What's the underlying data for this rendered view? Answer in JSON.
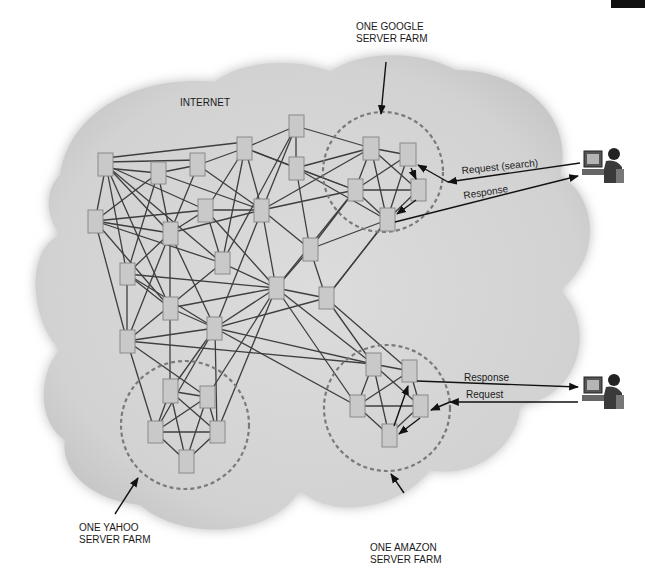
{
  "labels": {
    "internet": "INTERNET",
    "google_line1": "ONE GOOGLE",
    "google_line2": "SERVER FARM",
    "yahoo_line1": "ONE YAHOO",
    "yahoo_line2": "SERVER FARM",
    "amazon_line1": "ONE AMAZON",
    "amazon_line2": "SERVER FARM",
    "request_search": "Request (search)",
    "response_top": "Response",
    "response_bottom": "Response",
    "request_bottom": "Request"
  },
  "colors": {
    "cloud": "#d4d4d4",
    "node_fill": "#c9c9c9",
    "edge": "#3e3e3e",
    "farm_circle": "#7a7a7a"
  },
  "icons": {
    "user_top": "user-at-computer-icon",
    "user_bottom": "user-at-computer-icon"
  },
  "server_farms": [
    {
      "name": "google",
      "cx": 383,
      "cy": 172,
      "r": 60
    },
    {
      "name": "yahoo",
      "cx": 185,
      "cy": 425,
      "r": 64
    },
    {
      "name": "amazon",
      "cx": 387,
      "cy": 408,
      "r": 63
    }
  ]
}
